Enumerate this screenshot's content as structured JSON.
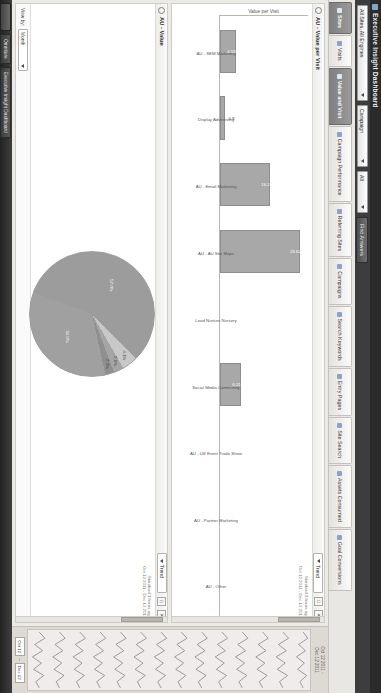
{
  "window": {
    "title": "Executive Insight Dashboard",
    "app_icon": "dashboard-icon"
  },
  "filterbar": {
    "scope": "All Sites, All Engines",
    "dimension": "Campaign",
    "value": "All",
    "find_button": "Find Answers"
  },
  "tabs": [
    {
      "label": "Sites",
      "icon": "globe-icon",
      "active": true
    },
    {
      "label": "Visits",
      "icon": "visits-icon",
      "active": false
    },
    {
      "label": "Value and Visit",
      "icon": "value-icon",
      "active": true
    },
    {
      "label": "Campaign Performance",
      "icon": "chart-icon",
      "active": false
    },
    {
      "label": "Referring Sites",
      "icon": "link-icon",
      "active": false
    },
    {
      "label": "Campaigns",
      "icon": "flag-icon",
      "active": false
    },
    {
      "label": "Search Keywords",
      "icon": "search-icon",
      "active": false
    },
    {
      "label": "Entry Pages",
      "icon": "page-icon",
      "active": false
    },
    {
      "label": "Site Search",
      "icon": "magnifier-icon",
      "active": false
    },
    {
      "label": "Assets Consumed",
      "icon": "asset-icon",
      "active": false
    },
    {
      "label": "Goal Conversions",
      "icon": "goal-icon",
      "active": false
    }
  ],
  "panels": [
    {
      "id": "value-per-visit",
      "title": "AU - Value per Visit",
      "trend_label": "Trend",
      "meta_line1": "Standard 3 hours ago",
      "meta_line2": "Oct 12 2011 - Dec 12 2011",
      "minimize": "□",
      "close": "✕"
    },
    {
      "id": "value",
      "title": "AU - Value",
      "trend_label": "Trend",
      "meta_line1": "Standard 3 hours ago",
      "meta_line2": "Oct 12 2011 - Dec 12 2011",
      "minimize": "□",
      "close": "✕",
      "view_by_label": "View by:",
      "view_by_value": "Month"
    }
  ],
  "rail": {
    "header_line1": "Oct 12 2011 -",
    "header_line2": "Dec 12 2011",
    "start_date": "Oct 12",
    "end_date": "Dec 12",
    "dash": "–"
  },
  "taskbar": {
    "start": "start-button",
    "items": [
      "Omniture",
      "Executive Insight Dashboard"
    ],
    "clock": ""
  },
  "chart_data": [
    {
      "type": "bar",
      "title": "AU - Value per Visit",
      "ylabel": "Value per Visit",
      "xlabel": "",
      "ylim": [
        0,
        30
      ],
      "grid": false,
      "legend": "none",
      "categories": [
        "AU - SEM Marketing",
        "Display Advertising",
        "AU - Email Marketing",
        "AU - AU Site Maps",
        "Lead Nurture Nursery",
        "Social Media Community",
        "AU - US Event Trade Show",
        "AU - Partner Marketing",
        "AU - Other"
      ],
      "values": [
        4.53,
        0.9,
        16.2,
        26.62,
        0,
        6.21,
        0,
        0,
        0
      ],
      "labels": [
        "4.53",
        "0.9",
        "16.2",
        "26.62",
        "",
        "6.21",
        "",
        "",
        ""
      ]
    },
    {
      "type": "pie",
      "title": "AU - Value",
      "ylabel": "",
      "xlabel": "",
      "legend": "none",
      "categories": [
        "AU - SEM Marketing",
        "Display Advertising",
        "AU - Email Marketing",
        "AU - AU Site Maps",
        "Social Media Community"
      ],
      "values": [
        57.0,
        4.1,
        2.6,
        2.3,
        34.0
      ],
      "labels": [
        "57.0%",
        "4.1%",
        "2.6%",
        "2.3%",
        "34.0%"
      ],
      "colors": [
        "#9c9c9c",
        "#c8c8c8",
        "#a5a5a5",
        "#8f8f8f",
        "#a0a0a0"
      ]
    }
  ]
}
